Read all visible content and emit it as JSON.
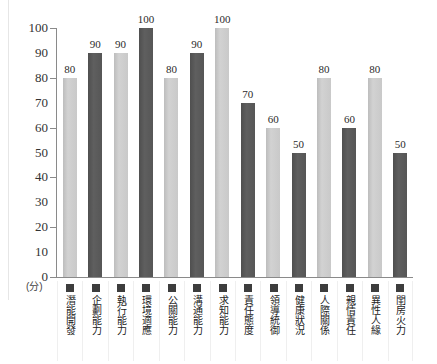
{
  "chart_data": {
    "type": "bar",
    "title": "",
    "xlabel": "",
    "ylabel": "",
    "unit_label": "(分)",
    "ylim": [
      0,
      100
    ],
    "ytick_step": 10,
    "ytick_labels": [
      "100",
      "90",
      "80",
      "70",
      "60",
      "50",
      "40",
      "30",
      "20",
      "10",
      "0"
    ],
    "ytick_values": [
      100,
      90,
      80,
      70,
      60,
      50,
      40,
      30,
      20,
      10,
      0
    ],
    "major_tick_values": [
      100,
      80,
      60,
      40,
      20,
      0
    ],
    "grid": false,
    "legend": "none",
    "categories": [
      "潛能開發",
      "企劃能力",
      "執行能力",
      "環境適應",
      "公關能力",
      "溝通能力",
      "求知能力",
      "責任態度",
      "領導統御",
      "健康狀況",
      "人際關係",
      "親情責任",
      "異性人緣",
      "閨房火力"
    ],
    "values": [
      80,
      90,
      90,
      100,
      80,
      90,
      100,
      70,
      60,
      50,
      80,
      60,
      80,
      50
    ],
    "value_labels": [
      "80",
      "90",
      "90",
      "100",
      "80",
      "90",
      "100",
      "70",
      "60",
      "50",
      "80",
      "60",
      "80",
      "50"
    ],
    "bar_shades": [
      "light",
      "dark",
      "light",
      "dark",
      "light",
      "dark",
      "light",
      "dark",
      "light",
      "dark",
      "light",
      "dark",
      "light",
      "dark"
    ],
    "colors": {
      "light_bar": "#c9c9c9",
      "dark_bar": "#565656",
      "axis": "#8a8a8a",
      "text": "#2b2b2b",
      "legend_square": "#3d3d3d",
      "background": "#ffffff"
    }
  }
}
